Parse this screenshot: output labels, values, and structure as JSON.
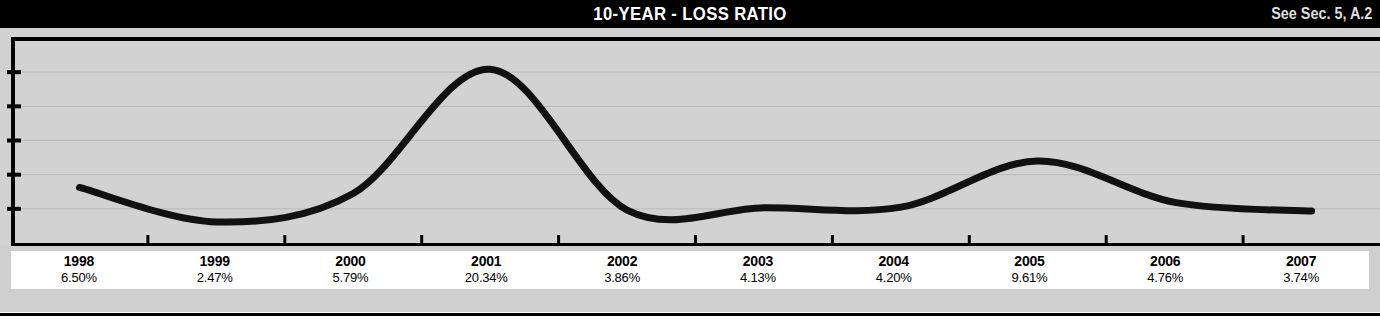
{
  "header": {
    "title": "10-YEAR - LOSS RATIO",
    "reference": "See Sec. 5, A.2",
    "background_color": "#000000",
    "text_color": "#FFFFFF"
  },
  "colors": {
    "plot_background": "#D2D2D2",
    "band_background": "#CFCFCF",
    "label_background": "#FFFFFF",
    "axis": "#000000",
    "line": "#111111",
    "gridline": "#B9B9B9"
  },
  "chart_data": {
    "type": "line",
    "title": "10-YEAR - LOSS RATIO",
    "xlabel": "",
    "ylabel": "",
    "categories": [
      "1998",
      "1999",
      "2000",
      "2001",
      "2002",
      "2003",
      "2004",
      "2005",
      "2006",
      "2007"
    ],
    "values": [
      6.5,
      2.47,
      5.79,
      20.34,
      3.86,
      4.13,
      4.2,
      9.61,
      4.76,
      3.74
    ],
    "value_labels": [
      "6.50%",
      "2.47%",
      "5.79%",
      "20.34%",
      "3.86%",
      "4.13%",
      "4.20%",
      "9.61%",
      "4.76%",
      "3.74%"
    ],
    "ylim": [
      0,
      24
    ],
    "y_tick_count": 5,
    "y_tick_labels": [],
    "grid": true,
    "legend": false,
    "smoothing": "spline",
    "line_width_px": 7
  },
  "labels": {
    "rows": [
      {
        "year": "1998",
        "percent": "6.50%"
      },
      {
        "year": "1999",
        "percent": "2.47%"
      },
      {
        "year": "2000",
        "percent": "5.79%"
      },
      {
        "year": "2001",
        "percent": "20.34%"
      },
      {
        "year": "2002",
        "percent": "3.86%"
      },
      {
        "year": "2003",
        "percent": "4.13%"
      },
      {
        "year": "2004",
        "percent": "4.20%"
      },
      {
        "year": "2005",
        "percent": "9.61%"
      },
      {
        "year": "2006",
        "percent": "4.76%"
      },
      {
        "year": "2007",
        "percent": "3.74%"
      }
    ]
  }
}
